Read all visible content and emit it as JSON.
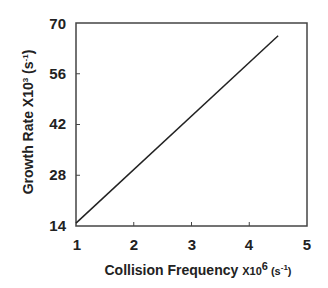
{
  "chart_data": {
    "type": "line",
    "title": "",
    "xlabel": "Collision Frequency X10^6 (s^-1)",
    "ylabel": "Growth Rate  X10^3 (s^-1)",
    "xlim": [
      1,
      5
    ],
    "ylim": [
      14,
      70
    ],
    "xticks": [
      1,
      2,
      3,
      4,
      5
    ],
    "yticks": [
      14,
      28,
      42,
      56,
      70
    ],
    "grid": false,
    "legend": null,
    "series": [
      {
        "name": "growth-rate",
        "x": [
          1.0,
          4.5
        ],
        "y": [
          14.8,
          66.5
        ],
        "color": "#222222"
      }
    ]
  },
  "labels": {
    "x_main": "Collision Frequency ",
    "x_mult": "X10",
    "x_exp": "6",
    "x_unit_open": " (s",
    "x_unit_exp": "-1",
    "x_unit_close": ")",
    "y_main": "Growth Rate  X10",
    "y_exp": "3",
    "y_unit_open": " (s",
    "y_unit_exp": "-1",
    "y_unit_close": ")"
  },
  "xtick_labels": [
    "1",
    "2",
    "3",
    "4",
    "5"
  ],
  "ytick_labels": [
    "14",
    "28",
    "42",
    "56",
    "70"
  ]
}
